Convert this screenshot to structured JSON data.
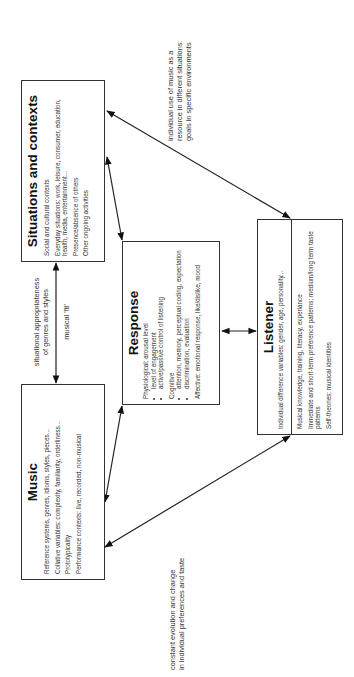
{
  "diagram": {
    "orientation": "rotated 90 degrees counter-clockwise",
    "boxes": {
      "situations": {
        "title": "Situations and contexts",
        "items": [
          "Social and cultural contexts",
          "Everyday situations: work, leisure, consumer, education, health, media, entertainment...",
          "Presence/absence of others",
          "Other ongoing activities"
        ]
      },
      "music": {
        "title": "Music",
        "items": [
          "Reference systems, genres, idioms, styles, pieces...",
          "Collative variables: complexity, familiarity, orderliness...",
          "Prototypicality",
          "Performance contexts: live, recorded, non-musical"
        ]
      },
      "response": {
        "title": "Response",
        "physiological_label": "Physiological: arousal level",
        "physiological_bullets": [
          "level of engagement",
          "active/passive control of listening"
        ],
        "cognitive_label": "Cognitive",
        "cognitive_bullets": [
          "attention, memory, perceptual coding, expectation",
          "discrimination, evaluation"
        ],
        "affective": "Affective: emotional response, like/dislike, mood"
      },
      "listener": {
        "title": "Listener",
        "top_item": "Individual difference variables: gender, age, personality...",
        "items": [
          "Musical knowledge, training, literacy, experiance",
          "Immediate and short-term preference patterns: medium/long term taste patterns",
          "Self-theories: musical identities"
        ]
      }
    },
    "labels": {
      "situational_fit_line1": "situational appropriateness",
      "situational_fit_line2": "of  genres and styles",
      "musical_fit": "musical 'fit'",
      "individual_use_line1": "individual use of music as a",
      "individual_use_line2": "resource in different situations:",
      "individual_use_line3": "goals in specific environments",
      "evolution_line1": "constant evolution and change",
      "evolution_line2": "in individual preferences and taste"
    },
    "arrows": [
      {
        "from": "music",
        "to": "situations",
        "type": "bidirectional"
      },
      {
        "from": "situations",
        "to": "response",
        "type": "bidirectional"
      },
      {
        "from": "music",
        "to": "response",
        "type": "bidirectional"
      },
      {
        "from": "response",
        "to": "listener",
        "type": "bidirectional"
      },
      {
        "from": "situations",
        "to": "listener",
        "type": "bidirectional"
      },
      {
        "from": "music",
        "to": "listener",
        "type": "bidirectional"
      }
    ],
    "colors": {
      "line": "#222222",
      "text": "#333333",
      "background": "#ffffff"
    }
  }
}
